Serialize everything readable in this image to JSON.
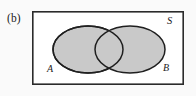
{
  "figure": {
    "panel_letter": "(b)",
    "caption_region": "venn-diagram-two-overlapping-sets",
    "background_color": "#fafafa"
  },
  "universe": {
    "label": "S",
    "border_color": "#2b2b2b",
    "fill_color": "#ffffff",
    "x": 32,
    "y": 11,
    "width": 152,
    "height": 74,
    "stroke_width": 1.6
  },
  "sets": [
    {
      "name": "set-a",
      "label": "A",
      "cx": 88,
      "cy": 49.5,
      "rx": 35,
      "ry": 23.5,
      "fill_color": "#c9c9c9",
      "stroke_color": "#1f1f1f",
      "stroke_width": 1.5,
      "shaded": true
    },
    {
      "name": "set-b",
      "label": "B",
      "cx": 130,
      "cy": 49.5,
      "rx": 35,
      "ry": 23.5,
      "fill_color": "#c9c9c9",
      "stroke_color": "#1f1f1f",
      "stroke_width": 1.5,
      "shaded": true
    }
  ],
  "shading": {
    "description": "both-ellipses-fully-shaded",
    "region": "A union B",
    "color": "#c9c9c9"
  }
}
